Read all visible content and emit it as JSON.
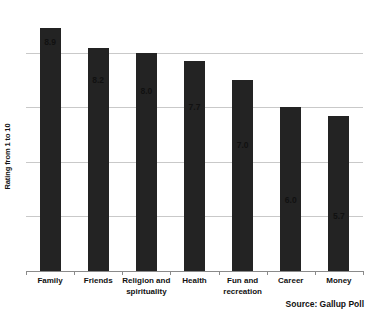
{
  "chart_data": {
    "type": "bar",
    "title": "",
    "subtitle": "",
    "xlabel": "",
    "ylabel": "Rating from 1 to 10",
    "categories": [
      "Family",
      "Friends",
      "Religion and spirituality",
      "Health",
      "Fun and recreation",
      "Career",
      "Money"
    ],
    "values": [
      8.9,
      8.2,
      8.0,
      7.7,
      7.0,
      6.0,
      5.7
    ],
    "value_labels": [
      "8.9",
      "8.2",
      "8.0",
      "7.7",
      "7.0",
      "6.0",
      "5.7"
    ],
    "ylim": [
      0,
      9.65
    ],
    "yticks": [
      0,
      2,
      4,
      6,
      8
    ],
    "ytick_labels": [
      "0",
      "2",
      "4",
      "6",
      "8"
    ],
    "grid": true,
    "legend": false,
    "bar_color": "#232323",
    "grid_color": "#c9c9c9",
    "axis_color": "#8a8a8a",
    "text_color": "#111111",
    "annotations": [
      "Source: Gallup Poll"
    ]
  },
  "footer": {
    "source": "Source: Gallup Poll"
  }
}
